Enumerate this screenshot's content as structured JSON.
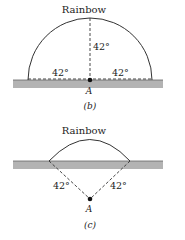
{
  "panels": [
    {
      "id": "b",
      "title": "Rainbow",
      "caption": "(b)",
      "observer": "A",
      "angles": [
        "42°",
        "42°",
        "42°"
      ]
    },
    {
      "id": "c",
      "title": "Rainbow",
      "caption": "(c)",
      "observer": "A",
      "angles": [
        "42°",
        "42°"
      ]
    }
  ],
  "colors": {
    "ground": "#b3b3b3",
    "ground_edge": "#666666",
    "line": "#333333"
  }
}
